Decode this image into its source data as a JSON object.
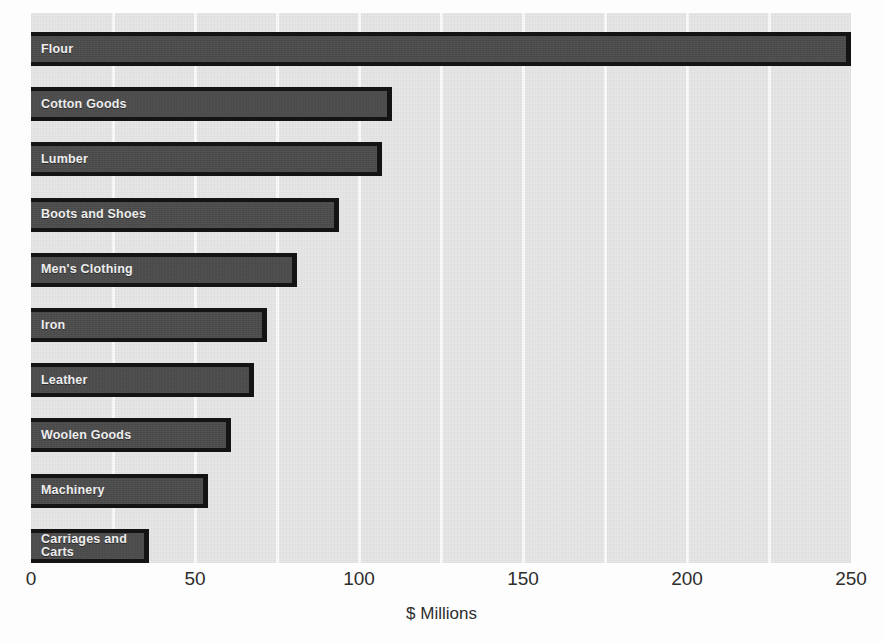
{
  "chart_data": {
    "type": "bar",
    "orientation": "horizontal",
    "title": "",
    "subtitle": "",
    "xlabel": "$ Millions",
    "ylabel": "",
    "xlim": [
      0,
      250
    ],
    "xticks": [
      0,
      50,
      100,
      150,
      200,
      250
    ],
    "xtick_labels": [
      "0",
      "50",
      "100",
      "150",
      "200",
      "250"
    ],
    "grid": "vertical",
    "legend": "none",
    "categories": [
      "Flour",
      "Cotton Goods",
      "Lumber",
      "Boots and Shoes",
      "Men's Clothing",
      "Iron",
      "Leather",
      "Woolen Goods",
      "Machinery",
      "Carriages and\nCarts"
    ],
    "values": [
      250,
      110,
      107,
      94,
      81,
      72,
      68,
      61,
      54,
      36
    ],
    "minor_gridlines": [
      25,
      50,
      75,
      100,
      125,
      150,
      175,
      200,
      225
    ],
    "colors": {
      "bar_fill": "#4a4a4a",
      "bar_border": "#141414",
      "bar_label": "#f2f2f2",
      "plot_background": "#e7e7e7",
      "gridline": "#fbfbfb",
      "axis_text": "#2e2e2e",
      "page_background": "#fdfdfd"
    }
  }
}
